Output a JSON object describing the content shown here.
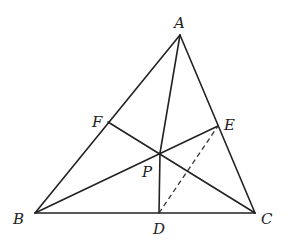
{
  "diagram": {
    "type": "triangle-cevians",
    "points": {
      "A": {
        "label": "A",
        "x": 180,
        "y": 35,
        "lx": 174,
        "ly": 28
      },
      "B": {
        "label": "B",
        "x": 35,
        "y": 213,
        "lx": 13,
        "ly": 224
      },
      "C": {
        "label": "C",
        "x": 255,
        "y": 213,
        "lx": 261,
        "ly": 224
      },
      "D": {
        "label": "D",
        "x": 159,
        "y": 213,
        "lx": 153,
        "ly": 234
      },
      "E": {
        "label": "E",
        "x": 218,
        "y": 126,
        "lx": 224,
        "ly": 130
      },
      "F": {
        "label": "F",
        "x": 108,
        "y": 122,
        "lx": 92,
        "ly": 127
      },
      "P": {
        "label": "P",
        "x": 160,
        "y": 153,
        "lx": 142,
        "ly": 177
      }
    },
    "solid_segments": [
      [
        "A",
        "B"
      ],
      [
        "B",
        "C"
      ],
      [
        "C",
        "A"
      ],
      [
        "A",
        "P"
      ],
      [
        "P",
        "D"
      ],
      [
        "B",
        "E"
      ],
      [
        "C",
        "F"
      ]
    ],
    "dashed_segments": [
      [
        "D",
        "E"
      ]
    ]
  }
}
